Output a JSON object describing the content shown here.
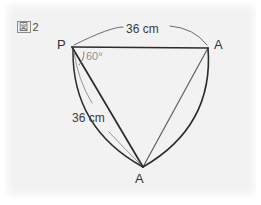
{
  "figure": {
    "caption_kanji": "図",
    "caption_number": "2",
    "caption_full": "図 2",
    "type": "geometry-diagram"
  },
  "labels": {
    "top_length": "36 cm",
    "left_length": "36 cm",
    "angle": "60°",
    "vertex_p": "P",
    "vertex_a_right": "A",
    "vertex_a_bottom": "A"
  },
  "measurements": {
    "radius_cm": 36,
    "arc_chord_cm": 36,
    "apex_angle_deg": 60,
    "unit": "cm"
  },
  "geometry": {
    "vertices": {
      "P": {
        "x": 72,
        "y": 47
      },
      "A_right": {
        "x": 208,
        "y": 48
      },
      "A_bottom": {
        "x": 143,
        "y": 167
      }
    },
    "edges": [
      {
        "name": "P-to-A-right",
        "style": "straight",
        "stroke": "#2b2b2b"
      },
      {
        "name": "P-to-A-bottom",
        "style": "straight",
        "stroke": "#2b2b2b"
      },
      {
        "name": "A-right-to-A-bottom",
        "style": "straight",
        "stroke": "#5a5a5a"
      },
      {
        "name": "arc-A-right-to-A-bottom",
        "style": "curved",
        "stroke": "#2b2b2b"
      },
      {
        "name": "arc-P-to-A-bottom",
        "style": "curved",
        "stroke": "#2b2b2b"
      }
    ],
    "leaders": [
      {
        "name": "top-dimension-arc",
        "target": "top_length"
      },
      {
        "name": "left-dimension-arc",
        "target": "left_length"
      }
    ],
    "angle_arc": {
      "at": "P",
      "value_deg": 60
    }
  },
  "colors": {
    "paper": "#f2f2f3",
    "page": "#ffffff",
    "ink_dark": "#2b2b2b",
    "ink_medium": "#5a5a5a",
    "ink_light": "#8f8f8f",
    "text": "#333333"
  }
}
